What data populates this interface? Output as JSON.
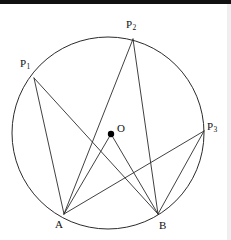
{
  "figure": {
    "background_color": "#ffffff",
    "stroke_color": "#2b2b2b",
    "label_color": "#111111",
    "top_bar_color": "#111111",
    "right_band_color": "#efefef"
  },
  "circle": {
    "name": "main-circle",
    "center_x": 108,
    "center_y": 133,
    "radius": 96
  },
  "points": [
    {
      "id": "P1",
      "label": "P",
      "subscript": "1",
      "x": 34,
      "y": 78,
      "label_x": 20,
      "label_y": 58,
      "on_circle": true
    },
    {
      "id": "P2",
      "label": "P",
      "subscript": "2",
      "x": 133,
      "y": 39,
      "label_x": 126,
      "label_y": 19,
      "on_circle": true
    },
    {
      "id": "P3",
      "label": "P",
      "subscript": "3",
      "x": 204,
      "y": 131,
      "label_x": 207,
      "label_y": 121,
      "on_circle": true
    },
    {
      "id": "O",
      "label": "O",
      "subscript": "",
      "x": 111,
      "y": 134,
      "label_x": 117,
      "label_y": 123,
      "on_circle": false
    },
    {
      "id": "A",
      "label": "A",
      "subscript": "",
      "x": 64,
      "y": 214,
      "label_x": 55,
      "label_y": 219,
      "on_circle": true
    },
    {
      "id": "B",
      "label": "B",
      "subscript": "",
      "x": 158,
      "y": 214,
      "label_x": 159,
      "label_y": 220,
      "on_circle": true
    }
  ],
  "segments": [
    {
      "name": "segment-p1-a",
      "from": "P1",
      "to": "A"
    },
    {
      "name": "segment-p1-b",
      "from": "P1",
      "to": "B"
    },
    {
      "name": "segment-p2-a",
      "from": "P2",
      "to": "A"
    },
    {
      "name": "segment-p2-b",
      "from": "P2",
      "to": "B"
    },
    {
      "name": "segment-p3-a",
      "from": "P3",
      "to": "A"
    },
    {
      "name": "segment-p3-b",
      "from": "P3",
      "to": "B"
    },
    {
      "name": "segment-o-a",
      "from": "O",
      "to": "A"
    },
    {
      "name": "segment-o-b",
      "from": "O",
      "to": "B"
    }
  ],
  "center_dot": {
    "name": "center-point-o",
    "radius": 3.2,
    "color": "#000000"
  }
}
